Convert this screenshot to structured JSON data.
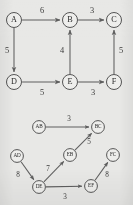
{
  "figure": {
    "background_color": "#e8e8e6",
    "ink_color": "#5e5e5e",
    "text_color": "#2b2b2b"
  },
  "chart_data": {
    "type": "diagram",
    "title": "",
    "subtitle": "",
    "xlabel": "",
    "ylabel": "",
    "legend": [],
    "graphs": [
      {
        "name": "original-graph",
        "directed": true,
        "weighted": true,
        "nodes": [
          {
            "id": "A",
            "label": "A",
            "x": 14,
            "y": 20,
            "r": 7.5
          },
          {
            "id": "B",
            "label": "B",
            "x": 70,
            "y": 20,
            "r": 7.5
          },
          {
            "id": "C",
            "label": "C",
            "x": 114,
            "y": 20,
            "r": 7.5
          },
          {
            "id": "D",
            "label": "D",
            "x": 14,
            "y": 82,
            "r": 7.5
          },
          {
            "id": "E",
            "label": "E",
            "x": 70,
            "y": 82,
            "r": 7.5
          },
          {
            "id": "F",
            "label": "F",
            "x": 114,
            "y": 82,
            "r": 7.5
          }
        ],
        "edges": [
          {
            "id": "AB",
            "from": "A",
            "to": "B",
            "weight": "6",
            "label_x": 42,
            "label_y": 11
          },
          {
            "id": "BC",
            "from": "B",
            "to": "C",
            "weight": "3",
            "label_x": 92,
            "label_y": 11
          },
          {
            "id": "AD",
            "from": "A",
            "to": "D",
            "weight": "5",
            "label_x": 7,
            "label_y": 51
          },
          {
            "id": "EB",
            "from": "E",
            "to": "B",
            "weight": "4",
            "label_x": 62,
            "label_y": 51
          },
          {
            "id": "FC",
            "from": "F",
            "to": "C",
            "weight": "5",
            "label_x": 121,
            "label_y": 51
          },
          {
            "id": "DE",
            "from": "D",
            "to": "E",
            "weight": "5",
            "label_x": 42,
            "label_y": 93
          },
          {
            "id": "EF",
            "from": "E",
            "to": "F",
            "weight": "3",
            "label_x": 93,
            "label_y": 93
          }
        ]
      },
      {
        "name": "line-graph",
        "directed": true,
        "weighted": true,
        "nodes": [
          {
            "id": "AB",
            "label": "AB",
            "x": 39,
            "y": 127,
            "r": 6.4
          },
          {
            "id": "BC",
            "label": "BC",
            "x": 98,
            "y": 127,
            "r": 6.4
          },
          {
            "id": "AD",
            "label": "AD",
            "x": 17,
            "y": 156,
            "r": 6.4
          },
          {
            "id": "EB",
            "label": "EB",
            "x": 70,
            "y": 155,
            "r": 6.4
          },
          {
            "id": "FC",
            "label": "FC",
            "x": 113,
            "y": 155,
            "r": 6.4
          },
          {
            "id": "DE",
            "label": "DE",
            "x": 39,
            "y": 187,
            "r": 6.4
          },
          {
            "id": "EF",
            "label": "EF",
            "x": 91,
            "y": 186,
            "r": 6.4
          }
        ],
        "edges": [
          {
            "id": "AB-BC",
            "from": "AB",
            "to": "BC",
            "weight": "3",
            "label_x": 69,
            "label_y": 119
          },
          {
            "id": "EB-BC",
            "from": "EB",
            "to": "BC",
            "weight": "5",
            "label_x": 89,
            "label_y": 142
          },
          {
            "id": "DE-EB",
            "from": "DE",
            "to": "EB",
            "weight": "7",
            "label_x": 48,
            "label_y": 169
          },
          {
            "id": "AD-DE",
            "from": "AD",
            "to": "DE",
            "weight": "8",
            "label_x": 18,
            "label_y": 175
          },
          {
            "id": "DE-EF",
            "from": "DE",
            "to": "EF",
            "weight": "3",
            "label_x": 65,
            "label_y": 197
          },
          {
            "id": "EF-FC",
            "from": "EF",
            "to": "FC",
            "weight": "8",
            "label_x": 107,
            "label_y": 175
          }
        ]
      }
    ]
  }
}
